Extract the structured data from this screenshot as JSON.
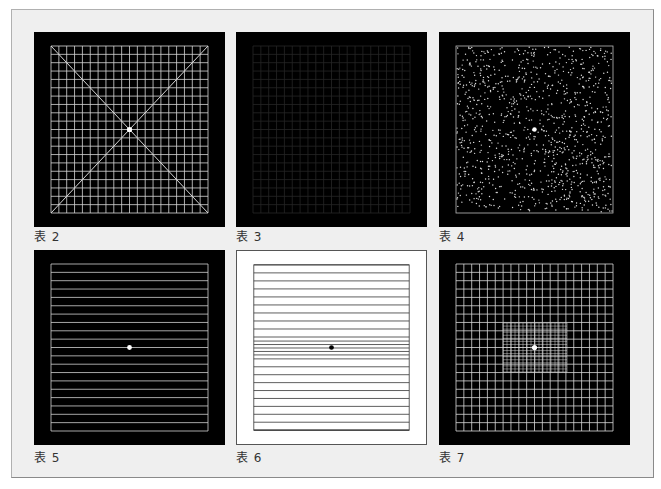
{
  "figure": {
    "panels": [
      {
        "id": "grid-with-diagonals",
        "label": "表 2",
        "background": "#000000",
        "line_color": "#d8d8d8",
        "description": "white grid with two diagonals and center dot"
      },
      {
        "id": "dim-grid",
        "label": "表 3",
        "background": "#000000",
        "line_color": "#262626",
        "description": "very faint grid on black"
      },
      {
        "id": "random-dots",
        "label": "表 4",
        "background": "#000000",
        "line_color": "#dddddd",
        "description": "random white dots field with center dot"
      },
      {
        "id": "horizontal-lines",
        "label": "表 5",
        "background": "#000000",
        "line_color": "#d0d0d0",
        "description": "horizontal white lines with center dot"
      },
      {
        "id": "horizontal-lines-inverted",
        "label": "表 6",
        "background": "#ffffff",
        "line_color": "#333333",
        "description": "black horizontal lines on white, denser near center dot"
      },
      {
        "id": "grid-fine-center",
        "label": "表 7",
        "background": "#000000",
        "line_color": "#d8d8d8",
        "description": "white grid with finer central grid and center dot"
      }
    ]
  },
  "colors": {
    "page_bg": "#ffffff",
    "frame_bg": "#efefef",
    "frame_border": "#8a8a8a",
    "label_text": "#333333"
  }
}
